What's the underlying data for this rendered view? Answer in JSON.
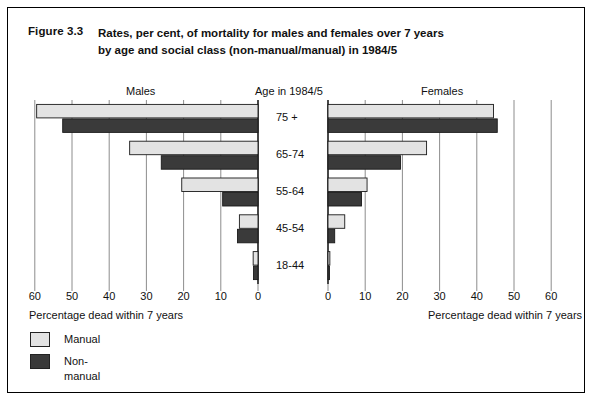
{
  "figure": {
    "number": "Figure 3.3",
    "title_line1": "Rates, per cent, of mortality for males and females over 7 years",
    "title_line2": "by age and social class (non-manual/manual) in 1984/5"
  },
  "captions": {
    "males": "Males",
    "age_group": "Age in 1984/5",
    "females": "Females"
  },
  "axis_titles": {
    "male": "Percentage dead within 7 years",
    "female": "Percentage dead within 7 years"
  },
  "legend": {
    "items": [
      {
        "label": "Manual",
        "color": "#e3e3e3"
      },
      {
        "label": "Non-manual",
        "color": "#3a3a3a"
      }
    ]
  },
  "colors": {
    "manual": "#e3e3e3",
    "non_manual": "#3a3a3a",
    "axis": "#808080",
    "outline": "#1a1a1a"
  },
  "chart_data": {
    "type": "bar",
    "subtype": "population-pyramid",
    "title": "Rates, per cent, of mortality for males and females over 7 years by age and social class (non-manual/manual) in 1984/5",
    "categories": [
      "75 +",
      "65-74",
      "55-64",
      "45-54",
      "18-44"
    ],
    "xlabel": "Percentage dead within 7 years",
    "ylabel": "Age in 1984/5",
    "xlim": [
      0,
      60
    ],
    "xticks": [
      0,
      10,
      20,
      30,
      40,
      50,
      60
    ],
    "male_tick_labels": [
      "60",
      "50",
      "40",
      "30",
      "20",
      "10",
      "0"
    ],
    "female_tick_labels": [
      "0",
      "10",
      "20",
      "30",
      "40",
      "50",
      "60"
    ],
    "grid": true,
    "legend_position": "bottom-left",
    "panels": [
      {
        "name": "Males",
        "direction": "left",
        "series": [
          {
            "name": "Manual",
            "values": [
              59.5,
              34.5,
              20.5,
              5.0,
              1.3
            ]
          },
          {
            "name": "Non-manual",
            "values": [
              52.5,
              26.0,
              9.5,
              5.5,
              1.2
            ]
          }
        ]
      },
      {
        "name": "Females",
        "direction": "right",
        "series": [
          {
            "name": "Manual",
            "values": [
              44.5,
              26.5,
              10.5,
              4.5,
              0.5
            ]
          },
          {
            "name": "Non-manual",
            "values": [
              45.5,
              19.5,
              9.0,
              1.8,
              0.4
            ]
          }
        ]
      }
    ]
  }
}
